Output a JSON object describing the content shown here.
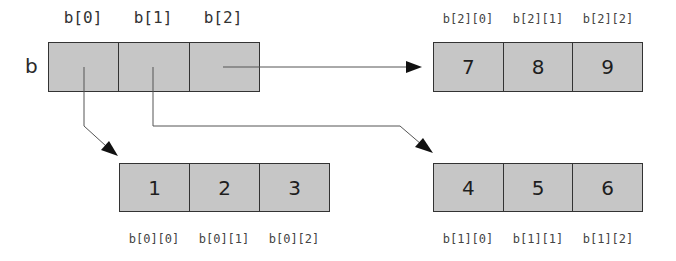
{
  "diagram": {
    "type": "2d-array-memory-layout",
    "variable": {
      "name": "b",
      "index_labels": [
        "b[0]",
        "b[1]",
        "b[2]"
      ]
    },
    "rows": [
      {
        "id": "b0",
        "values": [
          "1",
          "2",
          "3"
        ],
        "index_labels": [
          "b[0][0]",
          "b[0][1]",
          "b[0][2]"
        ]
      },
      {
        "id": "b1",
        "values": [
          "4",
          "5",
          "6"
        ],
        "index_labels": [
          "b[1][0]",
          "b[1][1]",
          "b[1][2]"
        ]
      },
      {
        "id": "b2",
        "values": [
          "7",
          "8",
          "9"
        ],
        "index_labels": [
          "b[2][0]",
          "b[2][1]",
          "b[2][2]"
        ]
      }
    ],
    "pointers": [
      {
        "from": "b[0]",
        "to": "b0"
      },
      {
        "from": "b[1]",
        "to": "b1"
      },
      {
        "from": "b[2]",
        "to": "b2"
      }
    ],
    "colors": {
      "cell_fill": "#c6c6c6",
      "border": "#333333",
      "arrow": "#555555",
      "arrowhead": "#111111"
    }
  }
}
